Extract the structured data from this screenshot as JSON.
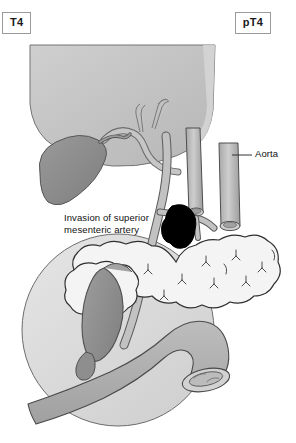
{
  "figure": {
    "background_color": "#ffffff"
  },
  "stage_labels": {
    "clinical": "T4",
    "pathologic": "pT4"
  },
  "annotations": {
    "sma": {
      "line1": "Invasion of superior",
      "line2": "mesenteric artery"
    },
    "aorta": {
      "label": "Aorta"
    }
  },
  "anatomy": {
    "stomach": {
      "name": "stomach",
      "fill": "#c4c4c4",
      "stroke": "#6f6f6f"
    },
    "gallbladder": {
      "name": "gallbladder",
      "fill": "#8d8d8d",
      "stroke": "#555555"
    },
    "mesentery": {
      "name": "transverse-mesocolon",
      "fill": "#dcdcdc",
      "stroke": "#5f5f5f"
    },
    "pancreas": {
      "name": "pancreas",
      "fill": "#f2f2f2",
      "stroke": "#3a3a3a"
    },
    "duodenum": {
      "name": "duodenum",
      "fill": "#b3b3b3",
      "stroke": "#555555"
    },
    "bowel_loop": {
      "name": "jejunum-loop",
      "fill": "#b0b0b0",
      "stroke": "#4a4a4a"
    },
    "aorta_vessel": {
      "name": "aorta",
      "fill": "#b8b8b8",
      "stroke": "#4a4a4a"
    },
    "vena_cava": {
      "name": "inferior-vena-cava",
      "fill": "#b8b8b8",
      "stroke": "#4a4a4a"
    },
    "superior_mesenteric_artery": {
      "name": "superior-mesenteric-artery",
      "fill": "#b8b8b8",
      "stroke": "#4a4a4a"
    },
    "tumor": {
      "name": "tumor-mass",
      "fill": "#000000",
      "stroke": "#000000"
    },
    "celiac_branches": {
      "name": "celiac-trunk-branches",
      "fill": "#bdbdbd",
      "stroke": "#6a6a6a"
    }
  },
  "colors": {
    "box_border": "#9a9a9a",
    "text": "#111111",
    "leader_line": "#333333"
  }
}
